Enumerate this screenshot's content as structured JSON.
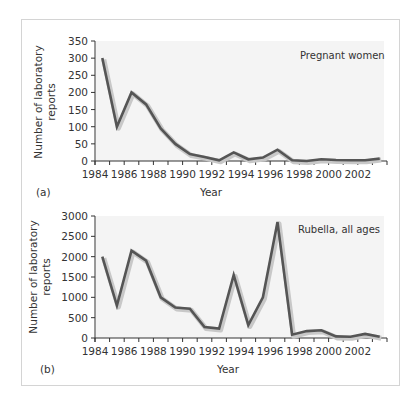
{
  "figure": {
    "panels": [
      {
        "letter": "(a)",
        "note": "Pregnant women",
        "xlabel": "Year",
        "ylabel_line1": "Number of laboratory",
        "ylabel_line2": "reports"
      },
      {
        "letter": "(b)",
        "note": "Rubella, all ages",
        "xlabel": "Year",
        "ylabel_line1": "Number of laboratory",
        "ylabel_line2": "reports"
      }
    ],
    "colors": {
      "line": "#555555",
      "line_shadow": "#c8c8c8",
      "plot_bg": "#f4f4f4",
      "frame": "#d4d4d4",
      "axis": "#333333"
    }
  },
  "chart_data": [
    {
      "type": "line",
      "title": "Pregnant women",
      "panel": "(a)",
      "xlabel": "Year",
      "ylabel": "Number of laboratory reports",
      "xlim": [
        1984,
        2004
      ],
      "ylim": [
        0,
        350
      ],
      "x_ticks": [
        "1984",
        "1986",
        "1988",
        "1990",
        "1992",
        "1994",
        "1996",
        "1998",
        "2000",
        "2002"
      ],
      "y_ticks": [
        "0",
        "50",
        "100",
        "150",
        "200",
        "250",
        "300",
        "350"
      ],
      "grid": false,
      "x": [
        1984.5,
        1985.5,
        1986.5,
        1987.5,
        1988.5,
        1989.5,
        1990.5,
        1991.5,
        1992.5,
        1993.5,
        1994.5,
        1995.5,
        1996.5,
        1997.5,
        1998.5,
        1999.5,
        2000.5,
        2001.5,
        2002.5,
        2003.5
      ],
      "series": [
        {
          "name": "Pregnant women",
          "values": [
            300,
            100,
            200,
            165,
            95,
            50,
            20,
            12,
            2,
            25,
            5,
            10,
            33,
            2,
            0,
            5,
            3,
            2,
            2,
            7
          ]
        }
      ]
    },
    {
      "type": "line",
      "title": "Rubella, all ages",
      "panel": "(b)",
      "xlabel": "Year",
      "ylabel": "Number of laboratory reports",
      "xlim": [
        1984,
        2004
      ],
      "ylim": [
        0,
        3000
      ],
      "x_ticks": [
        "1984",
        "1986",
        "1988",
        "1990",
        "1992",
        "1994",
        "1996",
        "1998",
        "2000",
        "2002"
      ],
      "y_ticks": [
        "0",
        "500",
        "1000",
        "1500",
        "2000",
        "2500",
        "3000"
      ],
      "grid": false,
      "x": [
        1984.5,
        1985.5,
        1986.5,
        1987.5,
        1988.5,
        1989.5,
        1990.5,
        1991.5,
        1992.5,
        1993.5,
        1994.5,
        1995.5,
        1996.5,
        1997.5,
        1998.5,
        1999.5,
        2000.5,
        2001.5,
        2002.5,
        2003.5
      ],
      "series": [
        {
          "name": "Rubella, all ages",
          "values": [
            2000,
            800,
            2150,
            1900,
            1000,
            750,
            720,
            270,
            230,
            1550,
            320,
            1000,
            2850,
            80,
            170,
            190,
            40,
            30,
            100,
            30
          ]
        }
      ]
    }
  ]
}
